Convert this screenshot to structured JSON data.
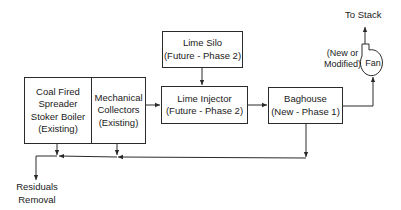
{
  "diagram": {
    "nodes": {
      "boiler": {
        "lines": [
          "Coal Fired",
          "Spreader",
          "Stoker Boiler",
          "(Existing)"
        ]
      },
      "mechanical": {
        "lines": [
          "Mechanical",
          "Collectors",
          "(Existing)"
        ]
      },
      "lime_silo": {
        "lines": [
          "Lime Silo",
          "(Future - Phase 2)"
        ]
      },
      "lime_injector": {
        "lines": [
          "Lime Injector",
          "(Future - Phase 2)"
        ]
      },
      "baghouse": {
        "lines": [
          "Baghouse",
          "(New - Phase 1)"
        ]
      },
      "fan": {
        "label": "Fan",
        "note_lines": [
          "(New or",
          "Modified)"
        ]
      }
    },
    "outputs": {
      "stack": "To Stack",
      "residuals": [
        "Residuals",
        "Removal"
      ]
    },
    "edges": [
      {
        "from": "boiler",
        "to": "mechanical"
      },
      {
        "from": "mechanical",
        "to": "lime_injector"
      },
      {
        "from": "lime_silo",
        "to": "lime_injector"
      },
      {
        "from": "lime_injector",
        "to": "baghouse"
      },
      {
        "from": "baghouse",
        "to": "fan"
      },
      {
        "from": "fan",
        "to": "stack"
      },
      {
        "from": "boiler",
        "to": "residuals"
      },
      {
        "from": "mechanical",
        "to": "residuals"
      },
      {
        "from": "baghouse",
        "to": "residuals"
      }
    ],
    "colors": {
      "line": "#2a2a2a",
      "background": "#ffffff"
    }
  }
}
